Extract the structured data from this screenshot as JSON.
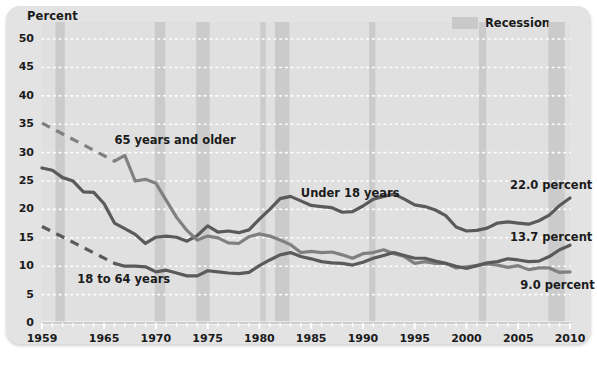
{
  "figure": {
    "panel_bg": "#e3e3e3",
    "plot_bg": "#e0e0e0",
    "recession_color": "#c9c9c9",
    "line_color_dark": "#5a5a5a",
    "line_color_mid": "#808080",
    "axis_title": "Percent",
    "legend": {
      "swatch_name": "recession-swatch",
      "label": "Recession"
    }
  },
  "chart_data": {
    "type": "line",
    "title": "",
    "subtitle": "",
    "xlabel": "",
    "ylabel": "Percent",
    "xlim": [
      1959,
      2010
    ],
    "ylim": [
      0,
      53
    ],
    "yticks": [
      0,
      5,
      10,
      15,
      20,
      25,
      30,
      35,
      40,
      45,
      50
    ],
    "ytick_labels": [
      "0",
      "5",
      "10",
      "15",
      "20",
      "25",
      "30",
      "35",
      "40",
      "45",
      "50"
    ],
    "xticks": [
      1959,
      1965,
      1970,
      1975,
      1980,
      1985,
      1990,
      1995,
      2000,
      2005,
      2010
    ],
    "xtick_labels": [
      "1959",
      "1965",
      "1970",
      "1975",
      "1980",
      "1985",
      "1990",
      "1995",
      "2000",
      "2005",
      "2010"
    ],
    "grid": "horizontal-dotted-white",
    "legend_position": "top-right",
    "annotations": [
      {
        "name": "label-65-and-older",
        "text": "65 years and older",
        "x": 1966.0,
        "y": 32.0
      },
      {
        "name": "label-18-to-64",
        "text": "18 to 64 years",
        "x": 1962.4,
        "y": 7.6
      },
      {
        "name": "label-under-18",
        "text": "Under 18 years",
        "x": 1984.0,
        "y": 22.8
      },
      {
        "name": "endlabel-under-18",
        "text": "22.0 percent",
        "x": 2004.2,
        "y": 24.2
      },
      {
        "name": "endlabel-65-and-older",
        "text": "13.7 percent",
        "x": 2004.2,
        "y": 15.0
      },
      {
        "name": "endlabel-18-to-64",
        "text": "9.0 percent",
        "x": 2005.2,
        "y": 6.6
      }
    ],
    "recessions": [
      {
        "start": 1960.3,
        "end": 1961.2
      },
      {
        "start": 1969.9,
        "end": 1970.9
      },
      {
        "start": 1973.9,
        "end": 1975.2
      },
      {
        "start": 1980.1,
        "end": 1980.6
      },
      {
        "start": 1981.5,
        "end": 1982.9
      },
      {
        "start": 1990.6,
        "end": 1991.2
      },
      {
        "start": 2001.2,
        "end": 2001.9
      },
      {
        "start": 2007.9,
        "end": 2009.5
      }
    ],
    "series": [
      {
        "name": "Under 18 years",
        "style": "solid",
        "color": "#5a5a5a",
        "end_label": "22.0 percent",
        "x": [
          1959,
          1960,
          1961,
          1962,
          1963,
          1964,
          1965,
          1966,
          1967,
          1968,
          1969,
          1970,
          1971,
          1972,
          1973,
          1974,
          1975,
          1976,
          1977,
          1978,
          1979,
          1980,
          1981,
          1982,
          1983,
          1984,
          1985,
          1986,
          1987,
          1988,
          1989,
          1990,
          1991,
          1992,
          1993,
          1994,
          1995,
          1996,
          1997,
          1998,
          1999,
          2000,
          2001,
          2002,
          2003,
          2004,
          2005,
          2006,
          2007,
          2008,
          2009,
          2010
        ],
        "values": [
          27.3,
          26.9,
          25.6,
          25.0,
          23.1,
          23.0,
          21.0,
          17.6,
          16.6,
          15.6,
          14.0,
          15.1,
          15.3,
          15.1,
          14.4,
          15.4,
          17.1,
          16.0,
          16.2,
          15.9,
          16.4,
          18.3,
          20.0,
          21.9,
          22.3,
          21.5,
          20.7,
          20.5,
          20.3,
          19.5,
          19.6,
          20.6,
          21.8,
          22.3,
          22.7,
          21.8,
          20.8,
          20.5,
          19.9,
          18.9,
          16.9,
          16.2,
          16.3,
          16.7,
          17.6,
          17.8,
          17.6,
          17.4,
          18.0,
          19.0,
          20.7,
          22.0
        ]
      },
      {
        "name": "65 years and older",
        "style": "solid-with-dashed-extension",
        "color": "#808080",
        "end_label": "13.7 percent",
        "dashed_x": [
          1959,
          1966
        ],
        "dashed_values": [
          35.2,
          28.5
        ],
        "x": [
          1966,
          1967,
          1968,
          1969,
          1970,
          1971,
          1972,
          1973,
          1974,
          1975,
          1976,
          1977,
          1978,
          1979,
          1980,
          1981,
          1982,
          1983,
          1984,
          1985,
          1986,
          1987,
          1988,
          1989,
          1990,
          1991,
          1992,
          1993,
          1994,
          1995,
          1996,
          1997,
          1998,
          1999,
          2000,
          2001,
          2002,
          2003,
          2004,
          2005,
          2006,
          2007,
          2008,
          2009,
          2010
        ],
        "values": [
          28.5,
          29.5,
          25.0,
          25.3,
          24.6,
          21.6,
          18.6,
          16.3,
          14.6,
          15.3,
          15.0,
          14.1,
          14.0,
          15.2,
          15.7,
          15.3,
          14.6,
          13.8,
          12.4,
          12.6,
          12.4,
          12.5,
          12.0,
          11.4,
          12.2,
          12.4,
          12.9,
          12.2,
          11.7,
          10.5,
          10.8,
          10.5,
          10.5,
          9.7,
          9.9,
          10.1,
          10.4,
          10.2,
          9.8,
          10.1,
          9.4,
          9.7,
          9.7,
          8.9,
          9.0
        ]
      },
      {
        "name": "18 to 64 years",
        "style": "solid-with-dashed-extension",
        "color": "#5a5a5a",
        "end_label": "9.0 percent",
        "dashed_x": [
          1959,
          1966
        ],
        "dashed_values": [
          17.0,
          10.5
        ],
        "x": [
          1966,
          1967,
          1968,
          1969,
          1970,
          1971,
          1972,
          1973,
          1974,
          1975,
          1976,
          1977,
          1978,
          1979,
          1980,
          1981,
          1982,
          1983,
          1984,
          1985,
          1986,
          1987,
          1988,
          1989,
          1990,
          1991,
          1992,
          1993,
          1994,
          1995,
          1996,
          1997,
          1998,
          1999,
          2000,
          2001,
          2002,
          2003,
          2004,
          2005,
          2006,
          2007,
          2008,
          2009,
          2010
        ],
        "values": [
          10.5,
          10.0,
          10.0,
          9.9,
          9.0,
          9.3,
          8.8,
          8.3,
          8.3,
          9.2,
          9.0,
          8.8,
          8.7,
          8.9,
          10.1,
          11.1,
          12.0,
          12.4,
          11.7,
          11.3,
          10.8,
          10.6,
          10.5,
          10.2,
          10.7,
          11.4,
          11.9,
          12.4,
          11.9,
          11.4,
          11.4,
          10.9,
          10.5,
          10.0,
          9.6,
          10.1,
          10.6,
          10.8,
          11.3,
          11.1,
          10.8,
          10.9,
          11.7,
          12.9,
          13.7
        ]
      }
    ]
  }
}
